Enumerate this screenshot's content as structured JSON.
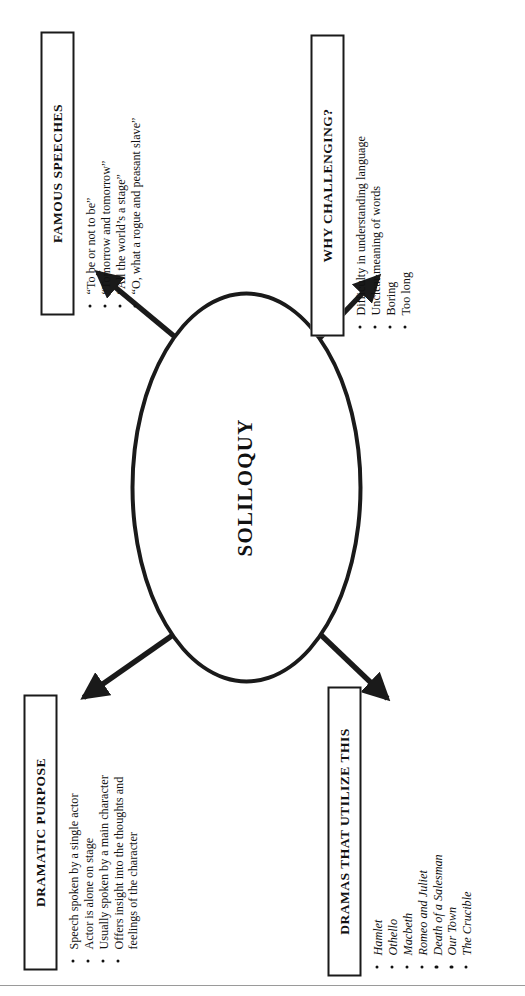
{
  "center": {
    "label": "SOLILOQUY",
    "shape": "ellipse"
  },
  "nodes": [
    {
      "id": "dramatic-purpose",
      "title": "DRAMATIC PURPOSE",
      "items": [
        "Speech spoken by a single actor",
        "Actor is alone on stage",
        "Usually spoken by a main character",
        "Offers insight into the thoughts and feelings of the character"
      ],
      "italic": false
    },
    {
      "id": "famous-speeches",
      "title": "FAMOUS SPEECHES",
      "items": [
        "“To be or not to be”",
        "“Tomorrow and tomorrow”",
        "“All the world’s a stage”",
        "“O, what a rogue and peasant slave”"
      ],
      "italic": false
    },
    {
      "id": "dramas",
      "title": "DRAMAS THAT UTILIZE THIS",
      "items": [
        "Hamlet",
        "Othello",
        "Macbeth",
        "Romeo and Juliet",
        "Death of a Salesman",
        "Our Town",
        "The Crucible"
      ],
      "italic": true
    },
    {
      "id": "why-challenging",
      "title": "WHY CHALLENGING?",
      "items": [
        "Difficulty in understanding language",
        "Unclear meaning of words",
        "Boring",
        "Too long"
      ],
      "italic": false
    }
  ],
  "colors": {
    "ink": "#1a1a1a",
    "text": "#111111",
    "background": "#ffffff",
    "rule": "#9a9a9a"
  }
}
